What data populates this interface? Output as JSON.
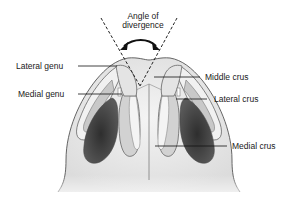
{
  "diagram": {
    "title": {
      "line1": "Angle of",
      "line2": "divergence"
    },
    "labels": {
      "lateral_genu": "Lateral genu",
      "medial_genu": "Medial genu",
      "middle_crus": "Middle crus",
      "lateral_crus": "Lateral crus",
      "medial_crus": "Medial crus"
    },
    "colors": {
      "outline": "#555555",
      "skin": "#e6e6e6",
      "cartilage_light": "#f2f2f2",
      "cartilage_mid": "#bdbdbd",
      "nostril": "#4a4a4a",
      "nostril_dark": "#333333",
      "leader": "#111111"
    }
  }
}
